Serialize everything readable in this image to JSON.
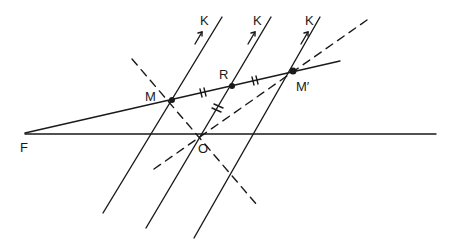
{
  "diagram": {
    "colors": {
      "ink": "#1a1a1a",
      "background": "#ffffff"
    },
    "labels": {
      "F": "F",
      "M": "M",
      "R": "R",
      "M_prime": "M′",
      "O": "O",
      "K1": "K",
      "K2": "K",
      "K3": "K"
    },
    "points": {
      "F": [
        25,
        133
      ],
      "M": [
        172,
        100
      ],
      "R": [
        232,
        86
      ],
      "M_prime": [
        293,
        71
      ],
      "O": [
        203,
        135
      ]
    },
    "lines": {
      "horizontal": {
        "from": [
          25,
          134
        ],
        "to": [
          436,
          134
        ],
        "style": "solid"
      },
      "ray_from_F": {
        "from": [
          25,
          133
        ],
        "to": [
          340,
          61
        ],
        "style": "solid"
      },
      "parallel_1": {
        "from": [
          103,
          213
        ],
        "to": [
          222,
          17
        ],
        "style": "solid"
      },
      "parallel_2": {
        "from": [
          146,
          228
        ],
        "to": [
          271,
          17
        ],
        "style": "solid"
      },
      "parallel_3": {
        "from": [
          194,
          238
        ],
        "to": [
          320,
          17
        ],
        "style": "solid"
      },
      "dashed_MO": {
        "from": [
          132,
          59
        ],
        "to": [
          257,
          205
        ],
        "style": "dashed"
      },
      "dashed_OM_prime": {
        "from": [
          154,
          169
        ],
        "to": [
          367,
          20
        ],
        "style": "dashed"
      }
    },
    "tick_marks": [
      "MR (double)",
      "RM′ (double)",
      "RO (double)"
    ]
  }
}
